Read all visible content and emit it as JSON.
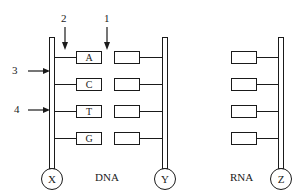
{
  "diagram": {
    "dna_label": "DNA",
    "rna_label": "RNA",
    "strands": {
      "x": "X",
      "y": "Y",
      "z": "Z"
    },
    "dna_bases_left": [
      "A",
      "C",
      "T",
      "G"
    ],
    "dna_bases_right": [
      "",
      "",
      "",
      ""
    ],
    "rna_bases": [
      "",
      "",
      "",
      ""
    ],
    "pointers": [
      {
        "number": "1",
        "direction": "down"
      },
      {
        "number": "2",
        "direction": "down"
      },
      {
        "number": "3",
        "direction": "right"
      },
      {
        "number": "4",
        "direction": "right"
      }
    ]
  }
}
